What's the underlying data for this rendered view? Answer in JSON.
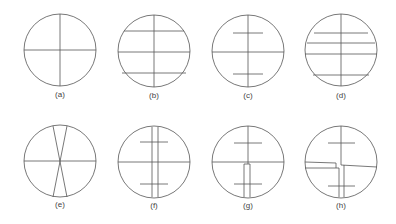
{
  "figure": {
    "stroke_color": "#555555",
    "panels": [
      {
        "id": "a",
        "label": "(a)",
        "cx": 60,
        "cy": 50,
        "r": 36,
        "lines": [
          [
            24,
            50,
            96,
            50
          ],
          [
            60,
            14,
            60,
            86
          ]
        ]
      },
      {
        "id": "b",
        "label": "(b)",
        "cx": 154,
        "cy": 51,
        "r": 36,
        "lines": [
          [
            118,
            52,
            190,
            52
          ],
          [
            154,
            15,
            154,
            87
          ],
          [
            124,
            31,
            184,
            31
          ],
          [
            122,
            73,
            186,
            73
          ]
        ]
      },
      {
        "id": "c",
        "label": "(c)",
        "cx": 248,
        "cy": 51,
        "r": 36,
        "lines": [
          [
            212,
            52,
            284,
            52
          ],
          [
            248,
            15,
            248,
            87
          ],
          [
            233,
            33,
            263,
            33
          ],
          [
            233,
            74,
            263,
            74
          ]
        ]
      },
      {
        "id": "d",
        "label": "(d)",
        "cx": 341,
        "cy": 50,
        "r": 36,
        "lines": [
          [
            305,
            54,
            377,
            54
          ],
          [
            341,
            14,
            341,
            86
          ],
          [
            314,
            33,
            368,
            33
          ],
          [
            307,
            43,
            375,
            43
          ],
          [
            313,
            75,
            369,
            75
          ]
        ]
      },
      {
        "id": "e",
        "label": "(e)",
        "cx": 60,
        "cy": 161,
        "r": 36,
        "lines": [
          [
            24,
            161,
            96,
            161
          ],
          [
            53,
            126,
            67,
            197
          ],
          [
            67,
            126,
            53,
            197
          ]
        ]
      },
      {
        "id": "f",
        "label": "(f)",
        "cx": 154,
        "cy": 162,
        "r": 36,
        "lines": [
          [
            118,
            162,
            190,
            162
          ],
          [
            152,
            127,
            152,
            197
          ],
          [
            158,
            127,
            158,
            197
          ],
          [
            140,
            142,
            168,
            142
          ],
          [
            140,
            184,
            168,
            184
          ]
        ]
      },
      {
        "id": "g",
        "label": "(g)",
        "cx": 248,
        "cy": 162,
        "r": 36,
        "lines": [
          [
            212,
            162,
            284,
            162
          ],
          [
            248,
            126,
            248,
            164
          ],
          [
            244,
            164,
            250,
            164
          ],
          [
            244,
            164,
            244,
            197
          ],
          [
            250,
            164,
            250,
            197
          ],
          [
            234,
            143,
            262,
            143
          ],
          [
            234,
            184,
            262,
            184
          ]
        ]
      },
      {
        "id": "h",
        "label": "(h)",
        "cx": 341,
        "cy": 162,
        "r": 36,
        "lines": [
          [
            341,
            126,
            341,
            165
          ],
          [
            341,
            165,
            377,
            167
          ],
          [
            305,
            162,
            336,
            163
          ],
          [
            305,
            168,
            339,
            168
          ],
          [
            336,
            163,
            336,
            168
          ],
          [
            339,
            168,
            339,
            197
          ],
          [
            344,
            165,
            344,
            197
          ],
          [
            328,
            143,
            355,
            143
          ],
          [
            328,
            186,
            355,
            186
          ]
        ]
      }
    ]
  }
}
